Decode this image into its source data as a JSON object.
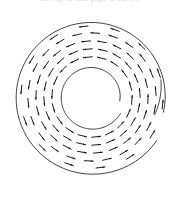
{
  "figure": {
    "caption_clipped": "the top of this page is cut off",
    "background_color": "#ffffff",
    "stroke_color": "#1a1a1a",
    "circle_stroke_color": "#2b2b2b",
    "circle_stroke_width": 0.9,
    "arrow_stroke_width": 1.0,
    "arrow_head_length": 2.6,
    "arrow_head_width": 1.7
  },
  "geometry": {
    "center_x": 92,
    "center_y": 97,
    "outer_radius": 78,
    "inner_radius": 33,
    "outer_gap_start_deg": 12,
    "outer_gap_end_deg": 34,
    "inner_gap_start_deg": 8,
    "inner_gap_end_deg": 30,
    "outer_spiral_offset": 5,
    "inner_spiral_offset": 5
  },
  "chart_data": {
    "type": "scatter",
    "subtitle": "",
    "xlabel": "",
    "ylabel": "",
    "xlim": [
      14,
      170
    ],
    "ylim": [
      19,
      175
    ],
    "grid": false,
    "legend": null,
    "annotations": [],
    "field": {
      "direction": "clockwise",
      "tangential": true,
      "radial_component": 0,
      "arrow_count": 96,
      "rings": [
        {
          "radius": 40,
          "count": 18,
          "phase_deg": 4
        },
        {
          "radius": 48,
          "count": 20,
          "phase_deg": 13
        },
        {
          "radius": 56,
          "count": 22,
          "phase_deg": 2
        },
        {
          "radius": 64,
          "count": 22,
          "phase_deg": 11
        },
        {
          "radius": 71,
          "count": 14,
          "phase_deg": 6
        }
      ],
      "arrow_length": 9
    }
  },
  "boundaries": [
    {
      "name": "outer-circle",
      "radius": 78,
      "gap": true
    },
    {
      "name": "inner-circle",
      "radius": 33,
      "gap": true
    }
  ]
}
